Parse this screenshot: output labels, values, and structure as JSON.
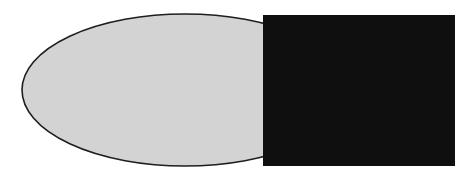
{
  "diagram": {
    "width": 474,
    "height": 178,
    "background": "#ffffff",
    "shapes": [
      {
        "type": "ellipse",
        "name": "gray-ellipse",
        "cx": 185,
        "cy": 90,
        "rx": 163,
        "ry": 76,
        "fill": "#d3d3d3",
        "stroke": "#1e1e1e",
        "stroke_width": 1.6
      },
      {
        "type": "rect",
        "name": "black-square",
        "x": 263,
        "y": 15,
        "width": 192,
        "height": 151,
        "fill": "#0f0f0f"
      }
    ]
  }
}
